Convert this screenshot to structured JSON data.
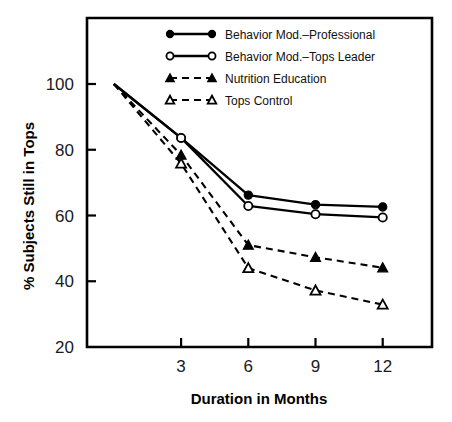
{
  "chart_data": {
    "type": "line",
    "title": "",
    "xlabel": "Duration in Months",
    "ylabel": "% Subjects Still in Tops",
    "x": [
      0,
      3,
      6,
      9,
      12
    ],
    "xticks": [
      3,
      6,
      9,
      12
    ],
    "xticklabels": [
      "3",
      "6",
      "9",
      "12"
    ],
    "yticks": [
      20,
      40,
      60,
      80,
      100
    ],
    "yticklabels": [
      "20",
      "40",
      "60",
      "80",
      "100"
    ],
    "xlim": [
      -1.2,
      14.2
    ],
    "ylim": [
      20,
      105
    ],
    "grid": false,
    "legend_position": "top-center-inside",
    "series": [
      {
        "name": "Behavior Mod.–Professional",
        "marker": "filled-circle",
        "linestyle": "solid",
        "values": [
          100,
          83.6,
          66.2,
          63.3,
          62.6
        ]
      },
      {
        "name": "Behavior Mod.–Tops Leader",
        "marker": "open-circle",
        "linestyle": "solid",
        "values": [
          100,
          83.6,
          62.9,
          60.4,
          59.4
        ]
      },
      {
        "name": "Nutrition Education",
        "marker": "filled-triangle",
        "linestyle": "dashed",
        "values": [
          100,
          78.4,
          51.0,
          47.3,
          44.1
        ]
      },
      {
        "name": "Tops Control",
        "marker": "open-triangle",
        "linestyle": "dashed",
        "values": [
          100,
          75.8,
          44.0,
          37.2,
          32.9
        ]
      }
    ]
  },
  "legend": {
    "entries": [
      {
        "label": "Behavior Mod.–Professional"
      },
      {
        "label": "Behavior Mod.–Tops Leader"
      },
      {
        "label": "Nutrition Education"
      },
      {
        "label": "Tops Control"
      }
    ]
  },
  "axes": {
    "x_title": "Duration in Months",
    "y_title": "% Subjects Still in Tops"
  }
}
